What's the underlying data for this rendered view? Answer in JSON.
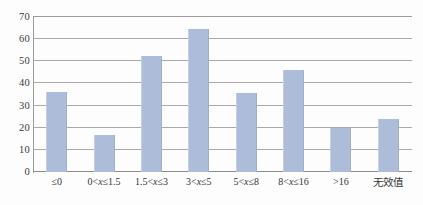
{
  "chart_data": {
    "type": "bar",
    "title": "",
    "subtitle": "",
    "xlabel": "",
    "ylabel": "",
    "ylim": [
      0,
      70
    ],
    "yticks": [
      0,
      10,
      20,
      30,
      40,
      50,
      60,
      70
    ],
    "ytick_labels": [
      "0",
      "10",
      "20",
      "30",
      "40",
      "50",
      "60",
      "70"
    ],
    "grid": true,
    "legend": false,
    "legend_position": "none",
    "categories": [
      "≤0",
      "0<x≤1.5",
      "1.5<x≤3",
      "3<x≤5",
      "5<x≤8",
      "8<x≤16",
      ">16",
      "无效值"
    ],
    "values": [
      36,
      16.5,
      52.5,
      64.5,
      35.5,
      46,
      20,
      24
    ],
    "series": [
      {
        "name": "",
        "values": [
          36,
          16.5,
          52.5,
          64.5,
          35.5,
          46,
          20,
          24
        ]
      }
    ],
    "bar_color": "#adbcd8",
    "grid_color": "#a9a9a9",
    "axis_color": "#8c8c8c",
    "text_color": "#353535"
  },
  "axis": {
    "y_ticks": [
      {
        "label": "70",
        "value": 70
      },
      {
        "label": "60",
        "value": 60
      },
      {
        "label": "50",
        "value": 50
      },
      {
        "label": "40",
        "value": 40
      },
      {
        "label": "30",
        "value": 30
      },
      {
        "label": "20",
        "value": 20
      },
      {
        "label": "10",
        "value": 10
      },
      {
        "label": "0",
        "value": 0
      }
    ],
    "x_categories": [
      {
        "label": "≤0",
        "parts": [
          {
            "t": "≤0",
            "italic": false
          }
        ],
        "cjk": false
      },
      {
        "label": "0<x≤1.5",
        "parts": [
          {
            "t": "0<",
            "italic": false
          },
          {
            "t": "x",
            "italic": true
          },
          {
            "t": "≤1.5",
            "italic": false
          }
        ],
        "cjk": false
      },
      {
        "label": "1.5<x≤3",
        "parts": [
          {
            "t": "1.5<",
            "italic": false
          },
          {
            "t": "x",
            "italic": true
          },
          {
            "t": "≤3",
            "italic": false
          }
        ],
        "cjk": false
      },
      {
        "label": "3<x≤5",
        "parts": [
          {
            "t": "3<",
            "italic": false
          },
          {
            "t": "x",
            "italic": true
          },
          {
            "t": "≤5",
            "italic": false
          }
        ],
        "cjk": false
      },
      {
        "label": "5<x≤8",
        "parts": [
          {
            "t": "5<",
            "italic": false
          },
          {
            "t": "x",
            "italic": true
          },
          {
            "t": "≤8",
            "italic": false
          }
        ],
        "cjk": false
      },
      {
        "label": "8<x≤16",
        "parts": [
          {
            "t": "8<",
            "italic": false
          },
          {
            "t": "x",
            "italic": true
          },
          {
            "t": "≤16",
            "italic": false
          }
        ],
        "cjk": false
      },
      {
        "label": ">16",
        "parts": [
          {
            "t": ">16",
            "italic": false
          }
        ],
        "cjk": false
      },
      {
        "label": "无效值",
        "parts": [
          {
            "t": "无效值",
            "italic": false
          }
        ],
        "cjk": true
      }
    ]
  }
}
